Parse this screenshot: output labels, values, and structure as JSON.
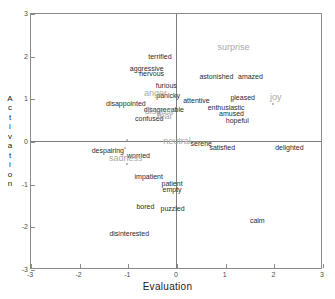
{
  "chart_data": {
    "type": "scatter",
    "title": "",
    "xlabel": "Evaluation",
    "ylabel": "Activation",
    "xlim": [
      -3,
      3
    ],
    "ylim": [
      -3,
      3
    ],
    "xticks": [
      "-3",
      "-2",
      "-1",
      "0",
      "1",
      "2",
      "3"
    ],
    "yticks": [
      "3",
      "2",
      "1",
      "0",
      "-1",
      "-2",
      "-3"
    ],
    "grid": false,
    "legend": "none",
    "axis_style": "zero-crossing-axes",
    "series": [
      {
        "name": "emotion terms",
        "color": "#2b2b2b",
        "points": [
          {
            "label": "terrified",
            "x": -0.33,
            "y": 2.0
          },
          {
            "label": "aggressive",
            "x": -0.6,
            "y": 1.72
          },
          {
            "label": "nervous",
            "x": -0.5,
            "y": 1.6
          },
          {
            "label": "furious",
            "x": -0.2,
            "y": 1.32
          },
          {
            "label": "panicky",
            "x": -0.16,
            "y": 1.08
          },
          {
            "label": "astonished",
            "x": 0.83,
            "y": 1.52
          },
          {
            "label": "amazed",
            "x": 1.53,
            "y": 1.52
          },
          {
            "label": "attentive",
            "x": 0.42,
            "y": 0.96
          },
          {
            "label": "pleased",
            "x": 1.37,
            "y": 1.03
          },
          {
            "label": "disappointed",
            "x": -1.03,
            "y": 0.9
          },
          {
            "label": "disagreeable",
            "x": -0.25,
            "y": 0.74
          },
          {
            "label": "enthusiastic",
            "x": 1.03,
            "y": 0.8
          },
          {
            "label": "amused",
            "x": 1.14,
            "y": 0.65
          },
          {
            "label": "hopeful",
            "x": 1.26,
            "y": 0.5
          },
          {
            "label": "confused",
            "x": -0.55,
            "y": 0.53
          },
          {
            "label": "serene",
            "x": 0.52,
            "y": -0.04
          },
          {
            "label": "satisfied",
            "x": 0.95,
            "y": -0.15
          },
          {
            "label": "delighted",
            "x": 2.33,
            "y": -0.13
          },
          {
            "label": "despairing",
            "x": -1.4,
            "y": -0.2
          },
          {
            "label": "worried",
            "x": -0.77,
            "y": -0.33
          },
          {
            "label": "impatient",
            "x": -0.56,
            "y": -0.82
          },
          {
            "label": "patient",
            "x": -0.08,
            "y": -0.98
          },
          {
            "label": "empty",
            "x": -0.08,
            "y": -1.13
          },
          {
            "label": "bored",
            "x": -0.63,
            "y": -1.52
          },
          {
            "label": "puzzled",
            "x": -0.07,
            "y": -1.58
          },
          {
            "label": "calm",
            "x": 1.67,
            "y": -1.85
          },
          {
            "label": "disinterested",
            "x": -0.96,
            "y": -2.15
          }
        ]
      },
      {
        "name": "emotion categories",
        "color": "#a8a8a8",
        "points": [
          {
            "label": "surprise",
            "x": 1.18,
            "y": 2.2
          },
          {
            "label": "joy",
            "x": 2.05,
            "y": 1.04
          },
          {
            "label": "anger",
            "x": -0.42,
            "y": 1.12
          },
          {
            "label": "disgust",
            "x": -0.35,
            "y": 0.7
          },
          {
            "label": "fear",
            "x": -0.23,
            "y": 0.58
          },
          {
            "label": "neutral",
            "x": 0.02,
            "y": 0.0
          },
          {
            "label": "sadness",
            "x": -1.03,
            "y": -0.4
          }
        ]
      }
    ],
    "markers": [
      {
        "x": -1.0,
        "y": 0.02
      },
      {
        "x": -1.04,
        "y": -0.16
      },
      {
        "x": -1.0,
        "y": -0.55
      },
      {
        "x": 2.0,
        "y": 0.86
      },
      {
        "x": 1.17,
        "y": 0.93
      }
    ]
  }
}
